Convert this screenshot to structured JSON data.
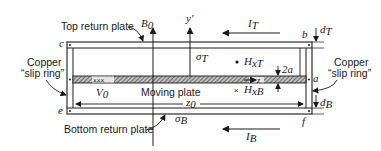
{
  "figure": {
    "colors": {
      "ink": "#1a1a1a",
      "background": "#ffffff",
      "hatch": "#555555"
    }
  },
  "labels": {
    "top_return_plate": "Top return plate",
    "bottom_return_plate": "Bottom return plate",
    "moving_plate": "Moving plate",
    "copper_left_line1": "Copper",
    "copper_left_line2": "“slip ring”",
    "copper_right_line1": "Copper",
    "copper_right_line2": "“slip ring”"
  },
  "symbols": {
    "B0": "B",
    "B0_sub": "0",
    "y_prime": "y′",
    "IT": "I",
    "IT_sub": "T",
    "IB": "I",
    "IB_sub": "B",
    "dT": "d",
    "dT_sub": "T",
    "dB": "d",
    "dB_sub": "B",
    "sigmaT": "σ",
    "sigmaT_sub": "T",
    "sigmaB": "σ",
    "sigmaB_sub": "B",
    "HxT": "H",
    "HxT_sub": "xT",
    "HxB": "H",
    "HxB_sub": "xB",
    "two_a": "2a",
    "V0": "V",
    "V0_sub": "0",
    "z0": "z",
    "z0_sub": "0",
    "z": "z",
    "xxx": "×××",
    "cross": "×",
    "dot": "•"
  },
  "corners": {
    "a": "a",
    "b": "b",
    "c": "c",
    "e": "e",
    "f": "f"
  }
}
